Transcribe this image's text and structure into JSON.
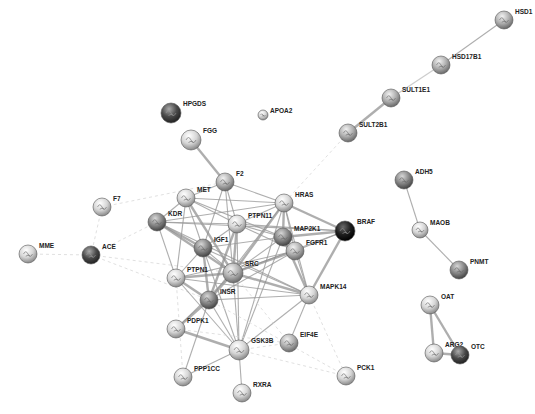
{
  "diagram": {
    "type": "protein-protein interaction network",
    "nodes": [
      {
        "id": "HSD1",
        "x": 504,
        "y": 20,
        "r": 9,
        "tone": "mid"
      },
      {
        "id": "HSD17B1",
        "x": 441,
        "y": 65,
        "r": 9,
        "tone": "mid"
      },
      {
        "id": "SULT1E1",
        "x": 391,
        "y": 98,
        "r": 9,
        "tone": "mid"
      },
      {
        "id": "SULT2B1",
        "x": 348,
        "y": 133,
        "r": 9,
        "tone": "mid"
      },
      {
        "id": "HPGDS",
        "x": 171,
        "y": 113,
        "r": 10,
        "tone": "dark"
      },
      {
        "id": "APOA2",
        "x": 263,
        "y": 115,
        "r": 5,
        "tone": "light"
      },
      {
        "id": "FGG",
        "x": 191,
        "y": 140,
        "r": 10,
        "tone": "light"
      },
      {
        "id": "F2",
        "x": 225,
        "y": 182,
        "r": 9,
        "tone": "mid"
      },
      {
        "id": "MET",
        "x": 186,
        "y": 198,
        "r": 9,
        "tone": "light"
      },
      {
        "id": "HRAS",
        "x": 284,
        "y": 203,
        "r": 9,
        "tone": "light"
      },
      {
        "id": "PTPN11",
        "x": 237,
        "y": 224,
        "r": 9,
        "tone": "light"
      },
      {
        "id": "KDR",
        "x": 157,
        "y": 222,
        "r": 9,
        "tone": "darkmid"
      },
      {
        "id": "MAP2K1",
        "x": 283,
        "y": 237,
        "r": 9,
        "tone": "darkmid"
      },
      {
        "id": "BRAF",
        "x": 345,
        "y": 231,
        "r": 10,
        "tone": "black"
      },
      {
        "id": "FGFR1",
        "x": 295,
        "y": 251,
        "r": 9,
        "tone": "mid"
      },
      {
        "id": "IGF1",
        "x": 203,
        "y": 248,
        "r": 9,
        "tone": "darkmid"
      },
      {
        "id": "SRC",
        "x": 233,
        "y": 273,
        "r": 10,
        "tone": "mid"
      },
      {
        "id": "PTPN1",
        "x": 176,
        "y": 278,
        "r": 9,
        "tone": "light"
      },
      {
        "id": "MAPK14",
        "x": 309,
        "y": 295,
        "r": 9,
        "tone": "light"
      },
      {
        "id": "INSR",
        "x": 209,
        "y": 300,
        "r": 9,
        "tone": "darkmid"
      },
      {
        "id": "F7",
        "x": 102,
        "y": 207,
        "r": 9,
        "tone": "light"
      },
      {
        "id": "ACE",
        "x": 91,
        "y": 255,
        "r": 9,
        "tone": "dark"
      },
      {
        "id": "MME",
        "x": 28,
        "y": 254,
        "r": 9,
        "tone": "light"
      },
      {
        "id": "ADH5",
        "x": 404,
        "y": 180,
        "r": 9,
        "tone": "darkmid"
      },
      {
        "id": "MAOB",
        "x": 420,
        "y": 230,
        "r": 8,
        "tone": "light"
      },
      {
        "id": "PNMT",
        "x": 459,
        "y": 270,
        "r": 9,
        "tone": "darkmid"
      },
      {
        "id": "OAT",
        "x": 430,
        "y": 305,
        "r": 9,
        "tone": "light"
      },
      {
        "id": "ARG2",
        "x": 434,
        "y": 353,
        "r": 9,
        "tone": "light"
      },
      {
        "id": "OTC",
        "x": 460,
        "y": 355,
        "r": 9,
        "tone": "dark"
      },
      {
        "id": "PDPK1",
        "x": 176,
        "y": 329,
        "r": 9,
        "tone": "light"
      },
      {
        "id": "GSK3B",
        "x": 239,
        "y": 350,
        "r": 10,
        "tone": "light"
      },
      {
        "id": "EIF4E",
        "x": 289,
        "y": 343,
        "r": 9,
        "tone": "mid"
      },
      {
        "id": "PPP1CC",
        "x": 183,
        "y": 377,
        "r": 9,
        "tone": "light"
      },
      {
        "id": "RXRA",
        "x": 242,
        "y": 393,
        "r": 9,
        "tone": "light"
      },
      {
        "id": "PCK1",
        "x": 346,
        "y": 376,
        "r": 9,
        "tone": "light"
      }
    ],
    "edges": [
      [
        "HSD1",
        "HSD17B1",
        "normal"
      ],
      [
        "HSD17B1",
        "SULT1E1",
        "light"
      ],
      [
        "SULT1E1",
        "SULT2B1",
        "strong"
      ],
      [
        "FGG",
        "F2",
        "strong"
      ],
      [
        "ADH5",
        "MAOB",
        "normal"
      ],
      [
        "MAOB",
        "PNMT",
        "normal"
      ],
      [
        "OAT",
        "ARG2",
        "strong"
      ],
      [
        "OAT",
        "OTC",
        "strong"
      ],
      [
        "ARG2",
        "OTC",
        "strong"
      ],
      [
        "MME",
        "ACE",
        "weak"
      ],
      [
        "F7",
        "ACE",
        "weak"
      ],
      [
        "ACE",
        "KDR",
        "weak"
      ],
      [
        "ACE",
        "SRC",
        "weak"
      ],
      [
        "ACE",
        "INSR",
        "weak"
      ],
      [
        "F7",
        "F2",
        "weak"
      ],
      [
        "SULT2B1",
        "HRAS",
        "weak"
      ],
      [
        "F2",
        "MET",
        "normal"
      ],
      [
        "F2",
        "HRAS",
        "normal"
      ],
      [
        "F2",
        "PTPN11",
        "normal"
      ],
      [
        "F2",
        "SRC",
        "normal"
      ],
      [
        "F2",
        "IGF1",
        "normal"
      ],
      [
        "MET",
        "HRAS",
        "normal"
      ],
      [
        "MET",
        "PTPN11",
        "normal"
      ],
      [
        "MET",
        "KDR",
        "normal"
      ],
      [
        "MET",
        "SRC",
        "strong"
      ],
      [
        "MET",
        "IGF1",
        "normal"
      ],
      [
        "MET",
        "MAP2K1",
        "normal"
      ],
      [
        "MET",
        "PTPN1",
        "normal"
      ],
      [
        "KDR",
        "PTPN11",
        "normal"
      ],
      [
        "KDR",
        "HRAS",
        "normal"
      ],
      [
        "KDR",
        "IGF1",
        "strong"
      ],
      [
        "KDR",
        "SRC",
        "strong"
      ],
      [
        "KDR",
        "PTPN1",
        "normal"
      ],
      [
        "KDR",
        "BRAF",
        "normal"
      ],
      [
        "KDR",
        "MAPK14",
        "normal"
      ],
      [
        "HRAS",
        "PTPN11",
        "normal"
      ],
      [
        "HRAS",
        "MAP2K1",
        "strong"
      ],
      [
        "HRAS",
        "BRAF",
        "strong"
      ],
      [
        "HRAS",
        "SRC",
        "strong"
      ],
      [
        "HRAS",
        "FGFR1",
        "normal"
      ],
      [
        "HRAS",
        "MAPK14",
        "normal"
      ],
      [
        "HRAS",
        "INSR",
        "normal"
      ],
      [
        "HRAS",
        "GSK3B",
        "normal"
      ],
      [
        "PTPN11",
        "MAP2K1",
        "normal"
      ],
      [
        "PTPN11",
        "SRC",
        "strong"
      ],
      [
        "PTPN11",
        "IGF1",
        "normal"
      ],
      [
        "PTPN11",
        "INSR",
        "strong"
      ],
      [
        "PTPN11",
        "FGFR1",
        "normal"
      ],
      [
        "PTPN11",
        "BRAF",
        "normal"
      ],
      [
        "PTPN11",
        "GSK3B",
        "normal"
      ],
      [
        "MAP2K1",
        "BRAF",
        "strong"
      ],
      [
        "MAP2K1",
        "FGFR1",
        "normal"
      ],
      [
        "MAP2K1",
        "MAPK14",
        "strong"
      ],
      [
        "MAP2K1",
        "SRC",
        "normal"
      ],
      [
        "MAP2K1",
        "GSK3B",
        "normal"
      ],
      [
        "MAP2K1",
        "IGF1",
        "normal"
      ],
      [
        "BRAF",
        "FGFR1",
        "normal"
      ],
      [
        "BRAF",
        "MAPK14",
        "strong"
      ],
      [
        "BRAF",
        "SRC",
        "normal"
      ],
      [
        "FGFR1",
        "SRC",
        "strong"
      ],
      [
        "FGFR1",
        "MAPK14",
        "normal"
      ],
      [
        "FGFR1",
        "PTPN1",
        "normal"
      ],
      [
        "FGFR1",
        "INSR",
        "normal"
      ],
      [
        "IGF1",
        "SRC",
        "normal"
      ],
      [
        "IGF1",
        "INSR",
        "strong"
      ],
      [
        "IGF1",
        "PTPN1",
        "normal"
      ],
      [
        "IGF1",
        "MAPK14",
        "normal"
      ],
      [
        "IGF1",
        "GSK3B",
        "normal"
      ],
      [
        "SRC",
        "PTPN1",
        "strong"
      ],
      [
        "SRC",
        "INSR",
        "strong"
      ],
      [
        "SRC",
        "MAPK14",
        "strong"
      ],
      [
        "SRC",
        "GSK3B",
        "normal"
      ],
      [
        "SRC",
        "PDPK1",
        "normal"
      ],
      [
        "PTPN1",
        "INSR",
        "strong"
      ],
      [
        "PTPN1",
        "MAPK14",
        "normal"
      ],
      [
        "PTPN1",
        "GSK3B",
        "normal"
      ],
      [
        "INSR",
        "PDPK1",
        "strong"
      ],
      [
        "INSR",
        "GSK3B",
        "normal"
      ],
      [
        "INSR",
        "MAPK14",
        "normal"
      ],
      [
        "INSR",
        "PPP1CC",
        "normal"
      ],
      [
        "MAPK14",
        "EIF4E",
        "normal"
      ],
      [
        "MAPK14",
        "GSK3B",
        "normal"
      ],
      [
        "MAPK14",
        "PCK1",
        "weak"
      ],
      [
        "PDPK1",
        "GSK3B",
        "strong"
      ],
      [
        "GSK3B",
        "PPP1CC",
        "normal"
      ],
      [
        "GSK3B",
        "RXRA",
        "normal"
      ],
      [
        "GSK3B",
        "EIF4E",
        "weak"
      ],
      [
        "GSK3B",
        "PCK1",
        "weak"
      ],
      [
        "EIF4E",
        "SRC",
        "weak"
      ],
      [
        "PCK1",
        "INSR",
        "weak"
      ],
      [
        "PDPK1",
        "EIF4E",
        "weak"
      ],
      [
        "PPP1CC",
        "PTPN1",
        "weak"
      ]
    ],
    "node_colors": {
      "light": "#d9d9d9",
      "mid": "#b8b8b8",
      "darkmid": "#8e8e8e",
      "dark": "#4e4e4e",
      "black": "#1e1e1e"
    }
  },
  "caption": ""
}
